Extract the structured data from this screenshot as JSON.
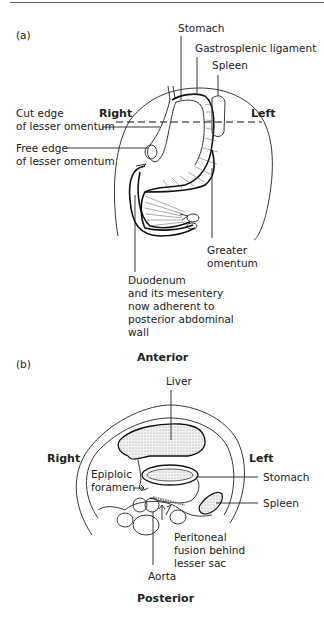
{
  "panel_a": {
    "tag": "(a)",
    "labels": {
      "stomach": "Stomach",
      "gastrosplenic": "Gastrosplenic ligament",
      "spleen": "Spleen",
      "right": "Right",
      "left": "Left",
      "cut_edge_1": "Cut edge",
      "cut_edge_2": "of lesser omentum",
      "free_edge_1": "Free edge",
      "free_edge_2": "of lesser omentum",
      "greater_1": "Greater",
      "greater_2": "omentum",
      "duo_1": "Duodenum",
      "duo_2": "and its mesentery",
      "duo_3": "now adherent to",
      "duo_4": "posterior abdominal",
      "duo_5": "wall"
    }
  },
  "panel_b": {
    "tag": "(b)",
    "labels": {
      "anterior": "Anterior",
      "liver": "Liver",
      "right": "Right",
      "left": "Left",
      "epiploic_1": "Epiploic",
      "epiploic_2": "foramen",
      "stomach": "Stomach",
      "spleen": "Spleen",
      "peritoneal_1": "Peritoneal",
      "peritoneal_2": "fusion behind",
      "peritoneal_3": "lesser sac",
      "aorta": "Aorta",
      "posterior": "Posterior"
    }
  }
}
